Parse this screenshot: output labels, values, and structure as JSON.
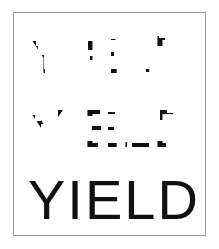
{
  "figure": {
    "word": "YIELD",
    "background_color": "#ffffff",
    "ink_color": "#111111",
    "frame_color": "#9a9a9a",
    "frame": {
      "x": 13,
      "y": 12,
      "width": 193,
      "height": 224
    },
    "rows": [
      {
        "id": "heavy-degraded",
        "label": "heavily degraded",
        "text": "YIELD",
        "degradation_level": "heavy",
        "visible_fraction": 0.12,
        "font_size": 54,
        "letter_spacing": 2,
        "text_x": 14,
        "text_y": 54,
        "mask_seed": 11,
        "fragments": [
          {
            "x": 16,
            "y": 22,
            "w": 6,
            "h": 7
          },
          {
            "x": 20,
            "y": 27,
            "w": 4,
            "h": 4
          },
          {
            "x": 23,
            "y": 36,
            "w": 7,
            "h": 16
          },
          {
            "x": 26,
            "y": 50,
            "w": 5,
            "h": 5
          },
          {
            "x": 48,
            "y": 44,
            "w": 5,
            "h": 9
          },
          {
            "x": 62,
            "y": 44,
            "w": 6,
            "h": 9
          },
          {
            "x": 74,
            "y": 22,
            "w": 17,
            "h": 5
          },
          {
            "x": 74,
            "y": 26,
            "w": 5,
            "h": 5
          },
          {
            "x": 76,
            "y": 37,
            "w": 9,
            "h": 4
          },
          {
            "x": 66,
            "y": 46,
            "w": 6,
            "h": 8
          },
          {
            "x": 97,
            "y": 20,
            "w": 7,
            "h": 20
          },
          {
            "x": 97,
            "y": 40,
            "w": 6,
            "h": 16
          },
          {
            "x": 136,
            "y": 16,
            "w": 9,
            "h": 6
          },
          {
            "x": 143,
            "y": 19,
            "w": 8,
            "h": 8
          },
          {
            "x": 149,
            "y": 25,
            "w": 6,
            "h": 9
          },
          {
            "x": 132,
            "y": 48,
            "w": 11,
            "h": 5
          }
        ]
      },
      {
        "id": "partial-degraded",
        "label": "partially degraded",
        "text": "YIELD",
        "degradation_level": "partial",
        "visible_fraction": 0.38,
        "font_size": 54,
        "letter_spacing": 2,
        "text_x": 14,
        "text_y": 54,
        "mask_seed": 23,
        "fragments": [
          {
            "x": 12,
            "y": 22,
            "w": 9,
            "h": 12
          },
          {
            "x": 20,
            "y": 28,
            "w": 7,
            "h": 7
          },
          {
            "x": 27,
            "y": 18,
            "w": 6,
            "h": 13
          },
          {
            "x": 22,
            "y": 38,
            "w": 7,
            "h": 16
          },
          {
            "x": 44,
            "y": 17,
            "w": 5,
            "h": 9
          },
          {
            "x": 44,
            "y": 30,
            "w": 5,
            "h": 8
          },
          {
            "x": 44,
            "y": 44,
            "w": 6,
            "h": 10
          },
          {
            "x": 62,
            "y": 18,
            "w": 6,
            "h": 10
          },
          {
            "x": 62,
            "y": 30,
            "w": 6,
            "h": 7
          },
          {
            "x": 62,
            "y": 43,
            "w": 7,
            "h": 11
          },
          {
            "x": 68,
            "y": 48,
            "w": 16,
            "h": 6
          },
          {
            "x": 72,
            "y": 17,
            "w": 14,
            "h": 6
          },
          {
            "x": 78,
            "y": 33,
            "w": 9,
            "h": 5
          },
          {
            "x": 94,
            "y": 19,
            "w": 7,
            "h": 12
          },
          {
            "x": 94,
            "y": 34,
            "w": 7,
            "h": 9
          },
          {
            "x": 94,
            "y": 45,
            "w": 7,
            "h": 9
          },
          {
            "x": 101,
            "y": 49,
            "w": 12,
            "h": 5
          },
          {
            "x": 118,
            "y": 17,
            "w": 8,
            "h": 22
          },
          {
            "x": 118,
            "y": 42,
            "w": 7,
            "h": 12
          },
          {
            "x": 125,
            "y": 49,
            "w": 10,
            "h": 5
          },
          {
            "x": 146,
            "y": 16,
            "w": 7,
            "h": 11
          },
          {
            "x": 151,
            "y": 20,
            "w": 8,
            "h": 18
          },
          {
            "x": 149,
            "y": 34,
            "w": 8,
            "h": 9
          },
          {
            "x": 138,
            "y": 48,
            "w": 14,
            "h": 6
          }
        ]
      },
      {
        "id": "clean",
        "label": "clean / intact",
        "text": "YIELD",
        "degradation_level": "none",
        "visible_fraction": 1.0,
        "font_size": 56,
        "letter_spacing": 2,
        "text_x": 14,
        "text_y": 52,
        "mask_seed": 0,
        "fragments": []
      }
    ]
  }
}
